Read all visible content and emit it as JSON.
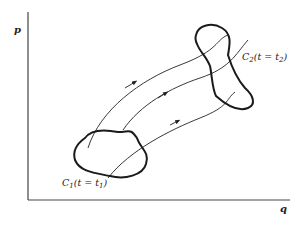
{
  "diagram": {
    "axes": {
      "y_label": "p",
      "x_label": "q"
    },
    "regions": [
      {
        "id": "C1",
        "label_main": "C",
        "label_sub": "1",
        "label_rest": "(t = t",
        "label_sub2": "1",
        "label_end": ")"
      },
      {
        "id": "C2",
        "label_main": "C",
        "label_sub": "2",
        "label_rest": "(t = t",
        "label_sub2": "2",
        "label_end": ")"
      }
    ],
    "trajectories": 3,
    "colors": {
      "ink": "#222222",
      "background": "#ffffff"
    }
  }
}
